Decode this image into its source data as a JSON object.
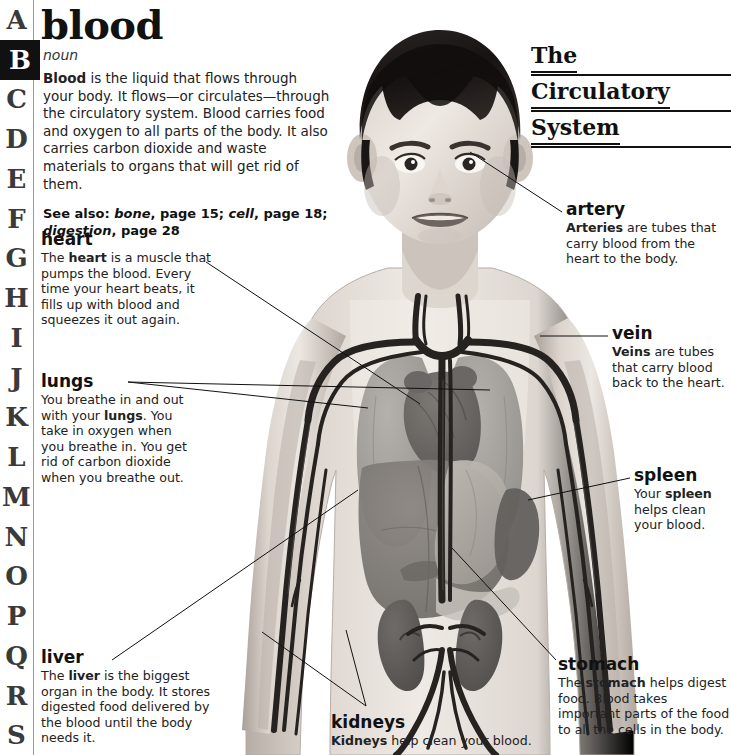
{
  "index_rail": {
    "letters": [
      "A",
      "B",
      "C",
      "D",
      "E",
      "F",
      "G",
      "H",
      "I",
      "J",
      "K",
      "L",
      "M",
      "N",
      "O",
      "P",
      "Q",
      "R",
      "S"
    ],
    "active_letter": "B"
  },
  "entry": {
    "headword": "blood",
    "part_of_speech": "noun",
    "definition_lead": "Blood",
    "definition_rest": " is the liquid that flows through your body. It flows—or circulates—through the circulatory system. Blood carries food and oxygen to all parts of the body. It also carries carbon dioxide and waste materials to organs that will get rid of them.",
    "see_also_label": "See also:",
    "see_also_entries": [
      {
        "term": "bone",
        "page": "page 15"
      },
      {
        "term": "cell",
        "page": "page 18"
      },
      {
        "term": "digestion",
        "page": "page 28"
      }
    ],
    "see_also_text": "See also: bone, page 15; cell, page 18; digestion, page 28"
  },
  "section_title": {
    "line1": "The",
    "line2": "Circulatory",
    "line3": "System"
  },
  "callouts": [
    {
      "key": "heart",
      "title": "heart",
      "body_html": "The <b>heart</b> is a muscle that pumps the blood. Every time your heart beats, it fills up with blood and squeezes it out again.",
      "body_text": "The heart is a muscle that pumps the blood. Every time your heart beats, it fills up with blood and squeezes it out again.",
      "side": "left"
    },
    {
      "key": "lungs",
      "title": "lungs",
      "body_html": "You breathe in and out with your <b>lungs</b>. You take in oxygen when you breathe in. You get rid of carbon dioxide when you breathe out.",
      "body_text": "You breathe in and out with your lungs. You take in oxygen when you breathe in. You get rid of carbon dioxide when you breathe out.",
      "side": "left"
    },
    {
      "key": "liver",
      "title": "liver",
      "body_html": "The <b>liver</b> is the biggest organ in the body. It stores digested food delivered by the blood until the body needs it.",
      "body_text": "The liver is the biggest organ in the body. It stores digested food delivered by the blood until the body needs it.",
      "side": "left"
    },
    {
      "key": "artery",
      "title": "artery",
      "body_html": "<b>Arteries</b> are tubes that carry blood from the heart to the body.",
      "body_text": "Arteries are tubes that carry blood from the heart to the body.",
      "side": "right"
    },
    {
      "key": "vein",
      "title": "vein",
      "body_html": "<b>Veins</b> are tubes that carry blood back to the heart.",
      "body_text": "Veins are tubes that carry blood back to the heart.",
      "side": "right"
    },
    {
      "key": "spleen",
      "title": "spleen",
      "body_html": "Your <b>spleen</b> helps clean your blood.",
      "body_text": "Your spleen helps clean your blood.",
      "side": "right"
    },
    {
      "key": "stomach",
      "title": "stomach",
      "body_html": "The <b>stomach</b> helps digest food. Blood takes important parts of the food to all the cells in the body.",
      "body_text": "The stomach helps digest food. Blood takes important parts of the food to all the cells in the body.",
      "side": "right"
    },
    {
      "key": "kidneys",
      "title": "kidneys",
      "body_html": "<b>Kidneys</b> help clean your blood.",
      "body_text": "Kidneys help clean your blood.",
      "side": "bottom"
    }
  ],
  "illustration": {
    "description": "Grayscale anatomical illustration of a young boy facing forward with the circulatory system, heart, lungs, liver, stomach, spleen and kidneys shown through the torso",
    "organs": [
      "heart",
      "lungs",
      "liver",
      "stomach",
      "spleen",
      "kidneys",
      "arteries",
      "veins"
    ]
  },
  "colors": {
    "ink": "#1a1a1a",
    "rule": "#9a9a9a",
    "active_tab_bg": "#111111",
    "active_tab_fg": "#ffffff",
    "skin_light": "#e8e3dd",
    "skin_mid": "#cfc7bf",
    "skin_shadow": "#a9a09a",
    "hair": "#1d1a19",
    "vessel": "#2a2726",
    "lung": "#9c9894",
    "liver": "#7d7874",
    "heart": "#6e6a67",
    "stomach": "#b4afaa",
    "spleen": "#6a6663",
    "kidney": "#5f5b58"
  }
}
